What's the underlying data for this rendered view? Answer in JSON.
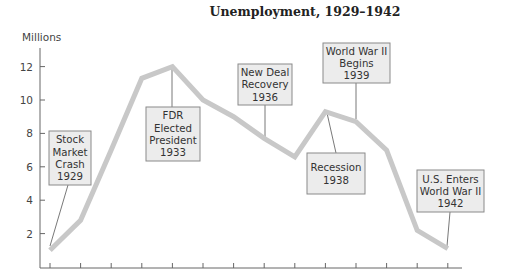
{
  "chart_data": {
    "type": "line",
    "title": "Unemployment, 1929–1942",
    "xlabel": "",
    "ylabel": "Millions",
    "x": [
      1929,
      1930,
      1931,
      1932,
      1933,
      1934,
      1935,
      1936,
      1937,
      1938,
      1939,
      1940,
      1941,
      1942
    ],
    "series": [
      {
        "name": "Unemployment (millions)",
        "values": [
          1.0,
          2.8,
          7.0,
          11.3,
          12.0,
          10.0,
          9.0,
          7.7,
          6.6,
          9.3,
          8.7,
          7.0,
          2.2,
          1.1
        ]
      }
    ],
    "yticks": [
      2,
      4,
      6,
      8,
      10,
      12
    ],
    "ylim": [
      0,
      13
    ],
    "grid": false,
    "legend": null,
    "annotations": [
      {
        "id": "crash",
        "lines": [
          "Stock",
          "Market",
          "Crash",
          "1929"
        ],
        "year": 1929
      },
      {
        "id": "fdr",
        "lines": [
          "FDR",
          "Elected",
          "President",
          "1933"
        ],
        "year": 1933
      },
      {
        "id": "newdeal",
        "lines": [
          "New Deal",
          "Recovery",
          "1936"
        ],
        "year": 1936
      },
      {
        "id": "ww2begins",
        "lines": [
          "World War II",
          "Begins",
          "1939"
        ],
        "year": 1939
      },
      {
        "id": "recession",
        "lines": [
          "Recession",
          "1938"
        ],
        "year": 1938
      },
      {
        "id": "usenters",
        "lines": [
          "U.S. Enters",
          "World War II",
          "1942"
        ],
        "year": 1942
      }
    ]
  },
  "colors": {
    "line": "#c8c8c8",
    "box_fill": "#ececec",
    "box_border": "#8a8a8a",
    "axis": "#666666"
  }
}
